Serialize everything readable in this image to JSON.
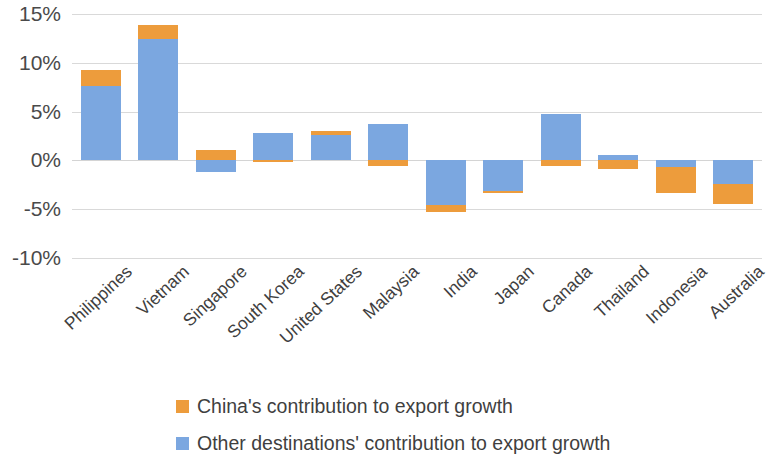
{
  "chart_data": {
    "type": "bar",
    "subtype": "stacked-bar-diverging",
    "title": "",
    "subtitle": "",
    "xlabel": "",
    "ylabel": "",
    "ylim": [
      -10,
      15
    ],
    "ytick_values": [
      15,
      10,
      5,
      0,
      -5,
      -10
    ],
    "ytick_labels": [
      "15%",
      "10%",
      "5%",
      "0%",
      "-5%",
      "-10%"
    ],
    "grid": true,
    "legend_position": "bottom",
    "value_unit": "percent",
    "categories": [
      "Philippines",
      "Vietnam",
      "Singapore",
      "South Korea",
      "United States",
      "Malaysia",
      "India",
      "Japan",
      "Canada",
      "Thailand",
      "Indonesia",
      "Australia"
    ],
    "series": [
      {
        "name": "China's contribution to export growth",
        "color": "#ed9c3c",
        "values": [
          1.7,
          1.5,
          1.1,
          -0.2,
          0.4,
          -0.6,
          -0.7,
          -0.2,
          -0.6,
          -0.9,
          -2.6,
          -2.1
        ]
      },
      {
        "name": "Other destinations' contribution to export growth",
        "color": "#7ba7e0",
        "values": [
          7.6,
          12.4,
          -1.2,
          2.8,
          2.6,
          3.7,
          -4.6,
          -3.1,
          4.8,
          0.6,
          -0.7,
          -2.4
        ]
      }
    ],
    "totals": [
      9.3,
      13.9,
      -0.1,
      2.6,
      3.0,
      3.1,
      -5.3,
      -3.3,
      4.2,
      -0.3,
      -3.3,
      -4.5
    ]
  },
  "legend": {
    "items": [
      {
        "label": "China's contribution to export growth",
        "color": "#ed9c3c"
      },
      {
        "label": "Other destinations' contribution to export growth",
        "color": "#7ba7e0"
      }
    ]
  }
}
